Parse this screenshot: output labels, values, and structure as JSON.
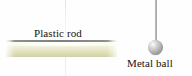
{
  "figure": {
    "background_color": "#fefefe",
    "width": 192,
    "height": 76
  },
  "labels": {
    "plastic_rod": "Plastic rod",
    "metal_ball": "Metal ball"
  },
  "objects": {
    "rod": {
      "name": "Plastic rod",
      "fill_color_top": "#fcfcf6",
      "fill_color_bottom": "#cfcfa6",
      "edge_color": "#80807a"
    },
    "ball": {
      "name": "Metal ball",
      "fill_color": "#bdbdbd",
      "highlight_color": "#ffffff",
      "shade_color": "#8d8d8d"
    },
    "string": {
      "name": "Suspension string",
      "color": "#9b9b9b"
    }
  }
}
